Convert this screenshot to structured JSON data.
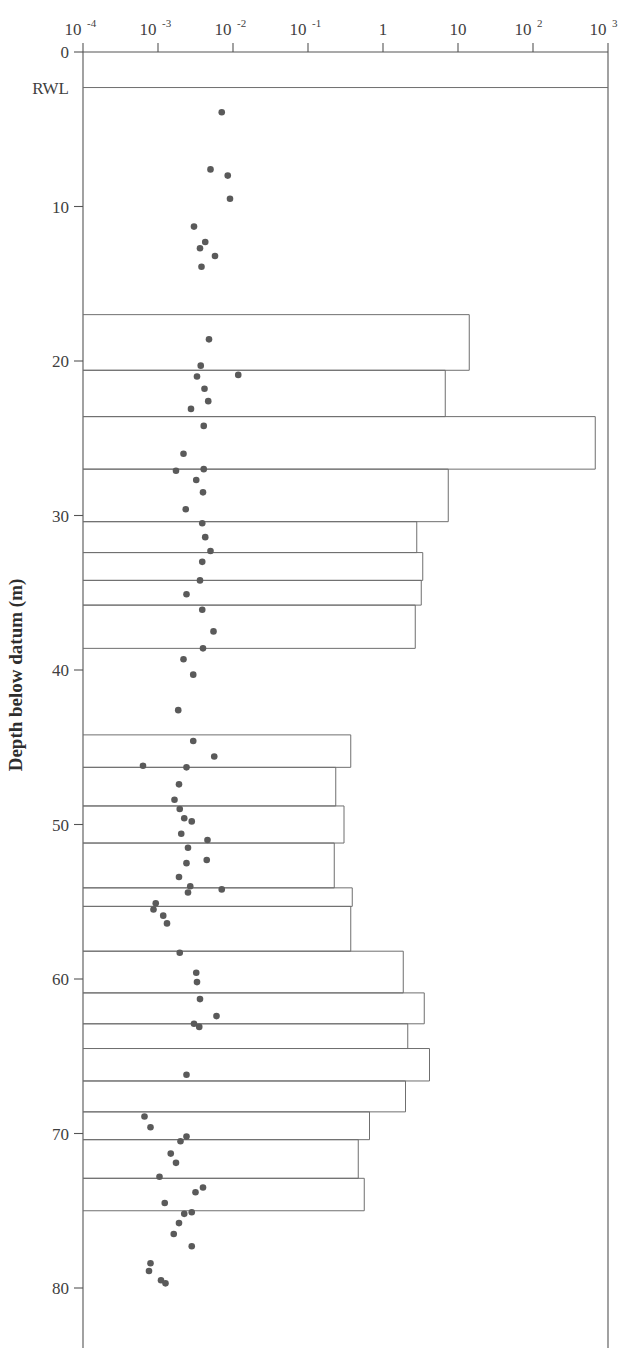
{
  "figure": {
    "top_partial_text": "",
    "background": "#ffffff",
    "ink_color": "#555555",
    "point_color": "#5a5a5a",
    "bar_color": "#6f6f6f"
  },
  "axes": {
    "y_axis_title": "Depth below datum (m)",
    "y_tick_labels": [
      "0",
      "RWL",
      "10",
      "20",
      "30",
      "40",
      "50",
      "60",
      "70",
      "80"
    ],
    "y_tick_values": [
      0,
      2.3,
      10,
      20,
      30,
      40,
      50,
      60,
      70,
      80
    ],
    "y_range": [
      0,
      84
    ],
    "x_tick_labels": [
      "10-4",
      "10-3",
      "10-2",
      "10-1",
      "1",
      "10",
      "102",
      "103"
    ],
    "x_tick_mantissa": [
      "10",
      "10",
      "10",
      "10",
      "1",
      "10",
      "10",
      "10"
    ],
    "x_tick_exponent": [
      "-4",
      "-3",
      "-2",
      "-1",
      "",
      "",
      "2",
      "3"
    ],
    "x_tick_values": [
      -4,
      -3,
      -2,
      -1,
      0,
      1,
      2,
      3
    ],
    "x_range_log10": [
      -4,
      3
    ],
    "x_axis_title": "",
    "grid": "off",
    "legend": "none"
  },
  "chart_data": {
    "type": "bar",
    "title": "",
    "subtitle": "",
    "xlabel": "",
    "ylabel": "Depth below datum (m)",
    "xlim_log10": [
      -4,
      3
    ],
    "ylim": [
      0,
      84
    ],
    "x_scale": "log",
    "y_scale": "linear",
    "y_inverted": true,
    "orientation": "horizontal",
    "grid": false,
    "legend_position": "none",
    "annotations": [
      {
        "label": "RWL",
        "depth_m": 2.3,
        "type": "horizontal-line"
      }
    ],
    "bars": [
      {
        "depth_top_m": 17.0,
        "depth_bottom_m": 20.6,
        "value_log10": 1.15,
        "value": 14.1
      },
      {
        "depth_top_m": 20.6,
        "depth_bottom_m": 23.6,
        "value_log10": 0.83,
        "value": 6.8
      },
      {
        "depth_top_m": 23.6,
        "depth_bottom_m": 27.0,
        "value_log10": 2.83,
        "value": 676.0
      },
      {
        "depth_top_m": 27.0,
        "depth_bottom_m": 30.4,
        "value_log10": 0.87,
        "value": 7.4
      },
      {
        "depth_top_m": 30.4,
        "depth_bottom_m": 32.4,
        "value_log10": 0.45,
        "value": 2.8
      },
      {
        "depth_top_m": 32.4,
        "depth_bottom_m": 34.2,
        "value_log10": 0.53,
        "value": 3.4
      },
      {
        "depth_top_m": 34.2,
        "depth_bottom_m": 35.8,
        "value_log10": 0.51,
        "value": 3.2
      },
      {
        "depth_top_m": 35.8,
        "depth_bottom_m": 38.6,
        "value_log10": 0.43,
        "value": 2.7
      },
      {
        "depth_top_m": 44.2,
        "depth_bottom_m": 46.3,
        "value_log10": -0.43,
        "value": 0.37
      },
      {
        "depth_top_m": 46.3,
        "depth_bottom_m": 48.8,
        "value_log10": -0.63,
        "value": 0.23
      },
      {
        "depth_top_m": 48.8,
        "depth_bottom_m": 51.2,
        "value_log10": -0.52,
        "value": 0.3
      },
      {
        "depth_top_m": 51.2,
        "depth_bottom_m": 54.1,
        "value_log10": -0.65,
        "value": 0.22
      },
      {
        "depth_top_m": 54.1,
        "depth_bottom_m": 55.3,
        "value_log10": -0.41,
        "value": 0.39
      },
      {
        "depth_top_m": 55.3,
        "depth_bottom_m": 58.2,
        "value_log10": -0.43,
        "value": 0.37
      },
      {
        "depth_top_m": 58.2,
        "depth_bottom_m": 60.9,
        "value_log10": 0.27,
        "value": 1.9
      },
      {
        "depth_top_m": 60.9,
        "depth_bottom_m": 62.9,
        "value_log10": 0.55,
        "value": 3.5
      },
      {
        "depth_top_m": 62.9,
        "depth_bottom_m": 64.5,
        "value_log10": 0.33,
        "value": 2.1
      },
      {
        "depth_top_m": 64.5,
        "depth_bottom_m": 66.6,
        "value_log10": 0.62,
        "value": 4.2
      },
      {
        "depth_top_m": 66.6,
        "depth_bottom_m": 68.6,
        "value_log10": 0.3,
        "value": 2.0
      },
      {
        "depth_top_m": 68.6,
        "depth_bottom_m": 70.4,
        "value_log10": -0.18,
        "value": 0.66
      },
      {
        "depth_top_m": 70.4,
        "depth_bottom_m": 72.9,
        "value_log10": -0.33,
        "value": 0.47
      },
      {
        "depth_top_m": 72.9,
        "depth_bottom_m": 75.0,
        "value_log10": -0.25,
        "value": 0.56
      }
    ],
    "points": {
      "name": "packer test / core permeability",
      "marker": "filled-circle",
      "values": [
        {
          "depth_m": 3.9,
          "value_log10": -2.15
        },
        {
          "depth_m": 7.6,
          "value_log10": -2.3
        },
        {
          "depth_m": 8.0,
          "value_log10": -2.07
        },
        {
          "depth_m": 9.5,
          "value_log10": -2.04
        },
        {
          "depth_m": 11.3,
          "value_log10": -2.52
        },
        {
          "depth_m": 12.3,
          "value_log10": -2.37
        },
        {
          "depth_m": 12.7,
          "value_log10": -2.44
        },
        {
          "depth_m": 13.2,
          "value_log10": -2.24
        },
        {
          "depth_m": 13.9,
          "value_log10": -2.42
        },
        {
          "depth_m": 18.6,
          "value_log10": -2.32
        },
        {
          "depth_m": 20.9,
          "value_log10": -1.93
        },
        {
          "depth_m": 20.3,
          "value_log10": -2.43
        },
        {
          "depth_m": 21.0,
          "value_log10": -2.48
        },
        {
          "depth_m": 21.8,
          "value_log10": -2.38
        },
        {
          "depth_m": 22.6,
          "value_log10": -2.33
        },
        {
          "depth_m": 23.1,
          "value_log10": -2.56
        },
        {
          "depth_m": 24.2,
          "value_log10": -2.39
        },
        {
          "depth_m": 26.0,
          "value_log10": -2.66
        },
        {
          "depth_m": 27.1,
          "value_log10": -2.76
        },
        {
          "depth_m": 27.0,
          "value_log10": -2.39
        },
        {
          "depth_m": 27.7,
          "value_log10": -2.49
        },
        {
          "depth_m": 28.5,
          "value_log10": -2.4
        },
        {
          "depth_m": 29.6,
          "value_log10": -2.63
        },
        {
          "depth_m": 30.5,
          "value_log10": -2.41
        },
        {
          "depth_m": 31.4,
          "value_log10": -2.37
        },
        {
          "depth_m": 32.3,
          "value_log10": -2.3
        },
        {
          "depth_m": 33.0,
          "value_log10": -2.41
        },
        {
          "depth_m": 34.2,
          "value_log10": -2.44
        },
        {
          "depth_m": 35.1,
          "value_log10": -2.62
        },
        {
          "depth_m": 36.1,
          "value_log10": -2.41
        },
        {
          "depth_m": 37.5,
          "value_log10": -2.26
        },
        {
          "depth_m": 38.6,
          "value_log10": -2.4
        },
        {
          "depth_m": 39.3,
          "value_log10": -2.66
        },
        {
          "depth_m": 40.3,
          "value_log10": -2.53
        },
        {
          "depth_m": 42.6,
          "value_log10": -2.73
        },
        {
          "depth_m": 44.6,
          "value_log10": -2.53
        },
        {
          "depth_m": 45.6,
          "value_log10": -2.25
        },
        {
          "depth_m": 46.3,
          "value_log10": -2.62
        },
        {
          "depth_m": 46.2,
          "value_log10": -3.2
        },
        {
          "depth_m": 47.4,
          "value_log10": -2.72
        },
        {
          "depth_m": 48.4,
          "value_log10": -2.78
        },
        {
          "depth_m": 49.0,
          "value_log10": -2.71
        },
        {
          "depth_m": 49.8,
          "value_log10": -2.55
        },
        {
          "depth_m": 49.6,
          "value_log10": -2.65
        },
        {
          "depth_m": 50.6,
          "value_log10": -2.69
        },
        {
          "depth_m": 51.0,
          "value_log10": -2.34
        },
        {
          "depth_m": 51.5,
          "value_log10": -2.6
        },
        {
          "depth_m": 52.3,
          "value_log10": -2.35
        },
        {
          "depth_m": 52.5,
          "value_log10": -2.62
        },
        {
          "depth_m": 53.4,
          "value_log10": -2.72
        },
        {
          "depth_m": 54.2,
          "value_log10": -2.15
        },
        {
          "depth_m": 54.0,
          "value_log10": -2.57
        },
        {
          "depth_m": 54.4,
          "value_log10": -2.6
        },
        {
          "depth_m": 55.1,
          "value_log10": -3.03
        },
        {
          "depth_m": 55.5,
          "value_log10": -3.06
        },
        {
          "depth_m": 55.9,
          "value_log10": -2.93
        },
        {
          "depth_m": 56.4,
          "value_log10": -2.88
        },
        {
          "depth_m": 58.3,
          "value_log10": -2.71
        },
        {
          "depth_m": 59.6,
          "value_log10": -2.49
        },
        {
          "depth_m": 60.2,
          "value_log10": -2.48
        },
        {
          "depth_m": 61.3,
          "value_log10": -2.44
        },
        {
          "depth_m": 62.9,
          "value_log10": -2.52
        },
        {
          "depth_m": 62.4,
          "value_log10": -2.22
        },
        {
          "depth_m": 63.1,
          "value_log10": -2.45
        },
        {
          "depth_m": 66.2,
          "value_log10": -2.62
        },
        {
          "depth_m": 68.9,
          "value_log10": -3.18
        },
        {
          "depth_m": 69.6,
          "value_log10": -3.1
        },
        {
          "depth_m": 70.2,
          "value_log10": -2.62
        },
        {
          "depth_m": 70.5,
          "value_log10": -2.7
        },
        {
          "depth_m": 71.3,
          "value_log10": -2.83
        },
        {
          "depth_m": 71.9,
          "value_log10": -2.76
        },
        {
          "depth_m": 72.8,
          "value_log10": -2.98
        },
        {
          "depth_m": 73.5,
          "value_log10": -2.4
        },
        {
          "depth_m": 73.8,
          "value_log10": -2.5
        },
        {
          "depth_m": 74.5,
          "value_log10": -2.91
        },
        {
          "depth_m": 75.2,
          "value_log10": -2.65
        },
        {
          "depth_m": 75.1,
          "value_log10": -2.55
        },
        {
          "depth_m": 75.8,
          "value_log10": -2.72
        },
        {
          "depth_m": 76.5,
          "value_log10": -2.79
        },
        {
          "depth_m": 77.3,
          "value_log10": -2.55
        },
        {
          "depth_m": 78.4,
          "value_log10": -3.1
        },
        {
          "depth_m": 78.9,
          "value_log10": -3.12
        },
        {
          "depth_m": 79.5,
          "value_log10": -2.96
        },
        {
          "depth_m": 79.7,
          "value_log10": -2.9
        }
      ]
    }
  }
}
